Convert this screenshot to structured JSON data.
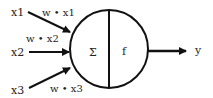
{
  "diagram": {
    "title": "",
    "inputs": [
      {
        "label": "x1",
        "weight_label": "w • x1"
      },
      {
        "label": "x2",
        "weight_label": "w • x2"
      },
      {
        "label": "x3",
        "weight_label": "w • x3"
      }
    ],
    "neuron": {
      "sum_symbol": "Σ",
      "activation_symbol": "f"
    },
    "output": {
      "label": "y"
    },
    "colors": {
      "stroke": "#111111",
      "background": "#ffffff"
    }
  }
}
